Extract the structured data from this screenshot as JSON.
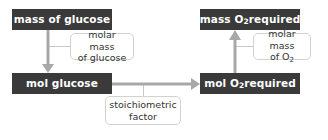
{
  "diagram": {
    "colors": {
      "node_fill": "#3a3a3a",
      "node_text": "#ffffff",
      "label_fill": "#ffffff",
      "label_border": "#d2d2d2",
      "label_text": "#333333",
      "arrow": "#a8a8a8",
      "connector": "#c9c9c9",
      "background": "#ffffff"
    },
    "nodes": [
      {
        "id": "mass-glucose",
        "label": "mass of glucose",
        "label_pre": "mass of glucose",
        "sub": "",
        "label_post": ""
      },
      {
        "id": "mol-glucose",
        "label": "mol glucose",
        "label_pre": "mol glucose",
        "sub": "",
        "label_post": ""
      },
      {
        "id": "mass-o2",
        "label": "mass O2 required",
        "label_pre": "mass O",
        "sub": "2",
        "label_post": " required"
      },
      {
        "id": "mol-o2",
        "label": "mol O2 required",
        "label_pre": "mol O",
        "sub": "2",
        "label_post": " required"
      }
    ],
    "labels": [
      {
        "id": "molar-glucose",
        "line1": "molar mass",
        "line2": "of glucose",
        "line2_pre": "of glucose",
        "sub": "",
        "line2_post": ""
      },
      {
        "id": "molar-o2",
        "line1": "molar mass",
        "line2": "of O2",
        "line2_pre": "of O",
        "sub": "2",
        "line2_post": ""
      },
      {
        "id": "stoichiometric",
        "line1": "stoichiometric",
        "line2": "factor",
        "line2_pre": "factor",
        "sub": "",
        "line2_post": ""
      }
    ],
    "arrows": [
      {
        "id": "mass-glucose-to-mol-glucose",
        "direction": "down",
        "from": "mass of glucose",
        "to": "mol glucose",
        "annotation": "molar mass of glucose"
      },
      {
        "id": "mol-glucose-to-mol-o2",
        "direction": "right",
        "from": "mol glucose",
        "to": "mol O2 required",
        "annotation": "stoichiometric factor"
      },
      {
        "id": "mol-o2-to-mass-o2",
        "direction": "up",
        "from": "mol O2 required",
        "to": "mass O2 required",
        "annotation": "molar mass of O2"
      }
    ]
  }
}
